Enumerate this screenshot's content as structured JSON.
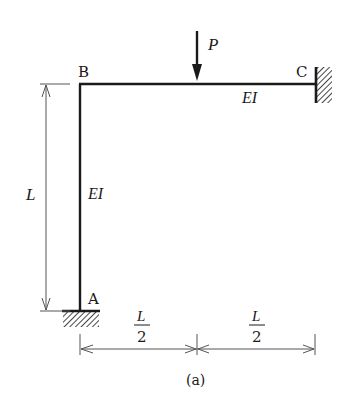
{
  "figure": {
    "caption": "(a)",
    "type": "rigid frame structural diagram"
  },
  "nodes": {
    "A": {
      "label": "A",
      "support": "fixed (ground)"
    },
    "B": {
      "label": "B",
      "support": "rigid joint"
    },
    "C": {
      "label": "C",
      "support": "fixed (wall)"
    }
  },
  "members": {
    "column": {
      "label": "EI",
      "from": "A",
      "to": "B"
    },
    "beam": {
      "label": "EI",
      "from": "B",
      "to": "C"
    }
  },
  "load": {
    "label": "P",
    "direction": "down",
    "position": "beam midspan"
  },
  "dimensions": {
    "height": "L",
    "left_span_num": "L",
    "left_span_den": "2",
    "right_span_num": "L",
    "right_span_den": "2"
  },
  "colors": {
    "stroke": "#1a1a1a",
    "dimension": "#555555",
    "background": "#ffffff"
  }
}
